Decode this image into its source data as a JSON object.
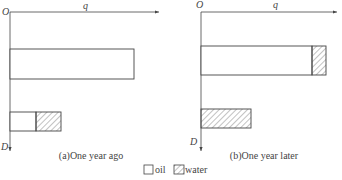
{
  "panels": [
    {
      "id": "a",
      "caption": "(a)One year ago",
      "origin_label": "O",
      "x_axis_label": "q",
      "y_axis_label": "D",
      "bars": [
        {
          "oil_fraction": 1.0,
          "water_fraction": 0.0,
          "length": 124
        },
        {
          "oil_fraction": 0.5,
          "water_fraction": 0.5,
          "length": 50
        }
      ]
    },
    {
      "id": "b",
      "caption": "(b)One year later",
      "origin_label": "O",
      "x_axis_label": "q",
      "y_axis_label": "D",
      "bars": [
        {
          "oil_fraction": 0.88,
          "water_fraction": 0.12,
          "length": 125
        },
        {
          "oil_fraction": 0.0,
          "water_fraction": 1.0,
          "length": 50
        }
      ]
    }
  ],
  "legend": {
    "items": [
      {
        "label": "oil",
        "pattern": "empty"
      },
      {
        "label": "water",
        "pattern": "hatched"
      }
    ]
  },
  "colors": {
    "line": "#444444",
    "hatch": "#666666",
    "background": "#ffffff"
  }
}
